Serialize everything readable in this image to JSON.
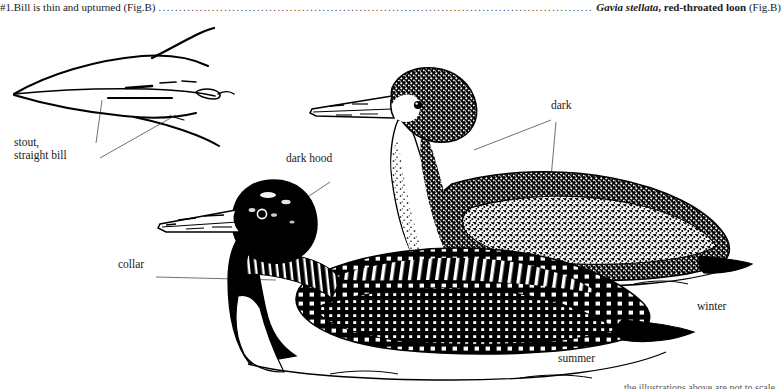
{
  "page": {
    "width": 781,
    "height": 389,
    "background": "#ffffff",
    "ink": "#000000"
  },
  "key_line": {
    "couplet_text": "#1.Bill is thin and upturned (Fig.B)",
    "leader_dots": "...................................................................................................................................................................................................................................",
    "genus": "Gavia",
    "species": " stellata",
    "common_name": ", red-throated loon ",
    "figure_ref": "(Fig.B)"
  },
  "bottom_caption": {
    "text": "the illustrations above are not to scale"
  },
  "illustration": {
    "title": "common loon plumage comparison",
    "bill_sketch": {
      "name": "stout straight bill outline sketch"
    },
    "labels": {
      "stout_bill": "stout,\nstraight bill",
      "dark_hood": "dark hood",
      "collar": "collar",
      "dark": "dark",
      "winter": "winter",
      "summer": "summer"
    }
  }
}
